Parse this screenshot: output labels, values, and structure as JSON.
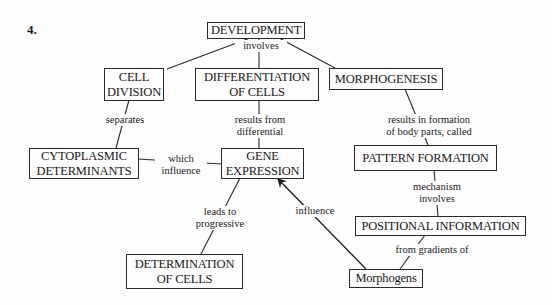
{
  "figure": {
    "number": "4."
  },
  "nodes": {
    "development": "DEVELOPMENT",
    "cell_division": "CELL\nDIVISION",
    "differentiation": "DIFFERENTIATION\nOF CELLS",
    "morphogenesis": "MORPHOGENESIS",
    "cytoplasmic": "CYTOPLASMIC\nDETERMINANTS",
    "gene_expression": "GENE\nEXPRESSION",
    "pattern_formation": "PATTERN FORMATION",
    "positional_information": "POSITIONAL INFORMATION",
    "determination": "DETERMINATION\nOF CELLS",
    "morphogens": "Morphogens"
  },
  "links": {
    "involves": "involves",
    "separates": "separates",
    "results_from": "results from\ndifferential",
    "results_in": "results in formation\nof body parts, called",
    "which_influence": "which\ninfluence",
    "mechanism": "mechanism\ninvolves",
    "leads_to": "leads to\nprogressive",
    "influence": "influence",
    "from_gradients": "from gradients of"
  },
  "style": {
    "line_color": "#2a2a2a",
    "background": "#fdfdfd"
  }
}
